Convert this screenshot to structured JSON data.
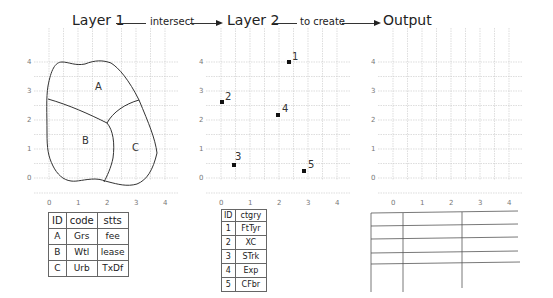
{
  "title": {
    "layer1": "Layer 1",
    "op1": "intersect",
    "layer2": "Layer 2",
    "op2": "to create",
    "output": "Output"
  },
  "axes": {
    "x_ticks": [
      "0",
      "1",
      "2",
      "3",
      "4"
    ],
    "y_ticks": [
      "0",
      "1",
      "2",
      "3",
      "4"
    ]
  },
  "layer1": {
    "polygon_labels": [
      "A",
      "B",
      "C"
    ],
    "table": {
      "headers": [
        "ID",
        "code",
        "stts"
      ],
      "rows": [
        [
          "A",
          "Grs",
          "fee"
        ],
        [
          "B",
          "Wtl",
          "lease"
        ],
        [
          "C",
          "Urb",
          "TxDf"
        ]
      ]
    }
  },
  "layer2": {
    "points": [
      {
        "id": "1",
        "x": 2.35,
        "y": 3.95
      },
      {
        "id": "2",
        "x": 0.05,
        "y": 2.6
      },
      {
        "id": "3",
        "x": 0.45,
        "y": 0.45
      },
      {
        "id": "4",
        "x": 1.95,
        "y": 2.15
      },
      {
        "id": "5",
        "x": 2.85,
        "y": 0.25
      }
    ],
    "table": {
      "headers": [
        "ID",
        "ctgry"
      ],
      "rows": [
        [
          "1",
          "FtTyr"
        ],
        [
          "2",
          "XC"
        ],
        [
          "3",
          "STrk"
        ],
        [
          "4",
          "Exp"
        ],
        [
          "5",
          "CFbr"
        ]
      ]
    }
  },
  "output": {
    "table": {
      "rows": 4,
      "cols": 3
    }
  }
}
